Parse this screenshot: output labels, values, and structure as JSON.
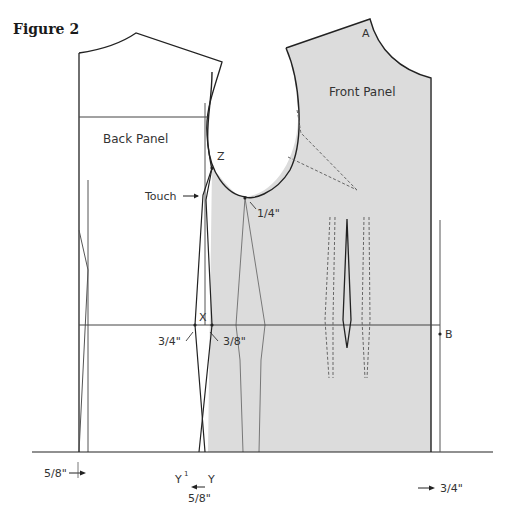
{
  "figure": {
    "title": "Figure 2"
  },
  "panels": {
    "back_panel": "Back Panel",
    "front_panel": "Front Panel"
  },
  "points": {
    "A": "A",
    "B": "B",
    "X": "X",
    "Y": "Y",
    "Y1": "Y",
    "Y1_sup": "1",
    "Z": "Z"
  },
  "annotations": {
    "touch": "Touch",
    "quarter_inch": "1/4\"",
    "three_quarter_left": "3/4\"",
    "three_eighth": "3/8\"",
    "five_eighth_left": "5/8\"",
    "five_eighth_bottom": "5/8\"",
    "three_quarter_right": "3/4\""
  },
  "colors": {
    "front_fill": "#dcdcdc",
    "line": "#222222",
    "thin_line": "#555555",
    "dashed": "#555555"
  }
}
